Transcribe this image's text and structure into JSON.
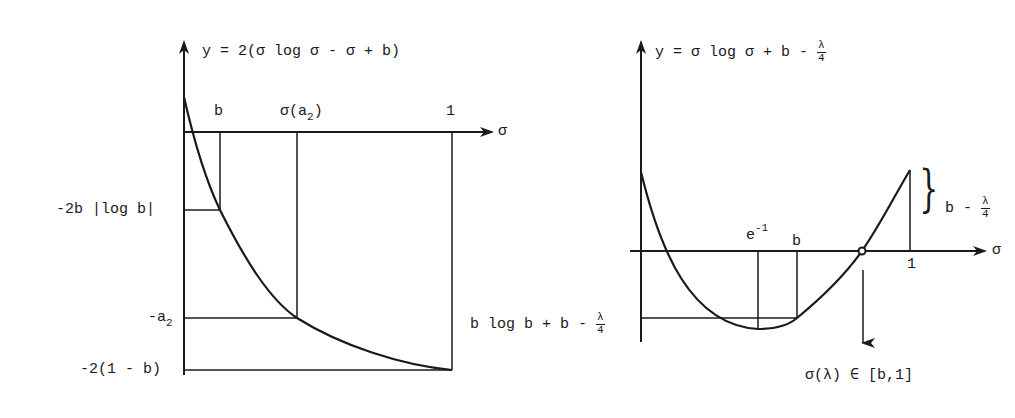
{
  "left_graph": {
    "title": "y = 2(σ log σ - σ + b)",
    "x_axis_label": "σ",
    "x_ticks": [
      {
        "label": "b",
        "x": 220
      },
      {
        "label": "σ(a",
        "sub": "2",
        "suffix": ")",
        "x": 297
      },
      {
        "label": "1",
        "x": 452
      }
    ],
    "y_ticks": [
      {
        "label": "-2b |log b|",
        "y": 210
      },
      {
        "label": "-a",
        "sub": "2",
        "y": 318
      },
      {
        "label": "-2(1 - b)",
        "y": 370
      }
    ]
  },
  "right_graph": {
    "title_prefix": "y = σ log σ + b -",
    "title_frac_num": "λ",
    "title_frac_den": "4",
    "x_axis_label": "σ",
    "x_ticks": [
      {
        "label": "e",
        "sup": "-1",
        "x": 758
      },
      {
        "label": "b",
        "x": 797
      },
      {
        "label": "1",
        "x": 910
      }
    ],
    "brace_label_prefix": "b -",
    "brace_frac_num": "λ",
    "brace_frac_den": "4",
    "min_label_prefix": "b log b + b -",
    "min_frac_num": "λ",
    "min_frac_den": "4",
    "root_label": "σ(λ) ∈ [b,1]"
  },
  "colors": {
    "ink": "#1a1a1a",
    "background": "#ffffff"
  }
}
